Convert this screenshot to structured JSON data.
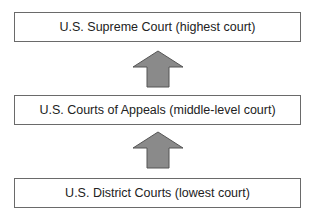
{
  "diagram": {
    "type": "hierarchy",
    "direction": "bottom-to-top",
    "levels": [
      {
        "label": "U.S. Supreme Court (highest court)"
      },
      {
        "label": "U.S. Courts of Appeals (middle-level court)"
      },
      {
        "label": "U.S. District Courts (lowest court)"
      }
    ],
    "arrow_color": "#8a8a8a",
    "border_color": "#6a6a6a"
  }
}
